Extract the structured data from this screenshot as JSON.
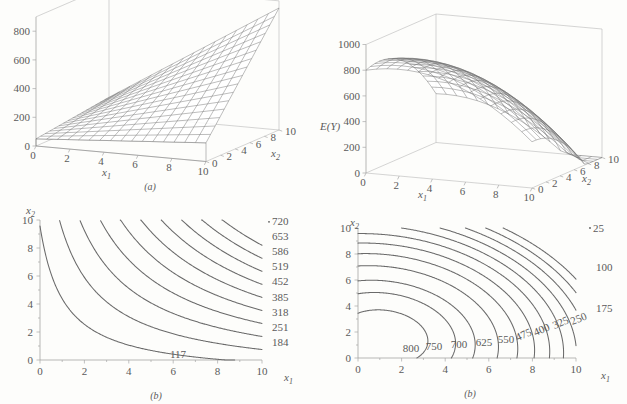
{
  "figure": {
    "panels": [
      "(a)",
      "(b)",
      "(a)",
      "(b)"
    ]
  },
  "chart_data": [
    {
      "id": "surface-linear-interaction",
      "type": "surface3d",
      "title": "",
      "panel_label": "(a)",
      "xlabel": "x₁",
      "ylabel": "x₂",
      "zlabel": "",
      "xlim": [
        0,
        10
      ],
      "ylim": [
        0,
        10
      ],
      "zlim": [
        0,
        900
      ],
      "xticks": [
        0,
        2,
        4,
        6,
        8,
        10
      ],
      "ytick_labels": [
        "0",
        "2",
        "4",
        "6",
        "8",
        "10"
      ],
      "zticks": [
        0,
        200,
        400,
        600,
        800
      ],
      "ztick_labels": [
        "0",
        "200",
        "400",
        "600",
        "800"
      ],
      "grid": true,
      "description": "Planar/ruled surface rising toward large x1 and x2; E(Y)=50+8x1+7x2+6.5x1x2 style first-order-with-interaction model",
      "corner_values": {
        "x1_0_x2_0": 50,
        "x1_10_x2_0": 130,
        "x1_0_x2_10": 120,
        "x1_10_x2_10": 850
      }
    },
    {
      "id": "contour-linear-interaction",
      "type": "contour",
      "panel_label": "(b)",
      "xlabel": "x₁",
      "ylabel": "x₂",
      "xlim": [
        0,
        10
      ],
      "ylim": [
        0,
        10
      ],
      "xticks": [
        0,
        2,
        4,
        6,
        8,
        10
      ],
      "yticks": [
        0,
        2,
        4,
        6,
        8,
        10
      ],
      "xtick_labels": [
        "0",
        "2",
        "4",
        "6",
        "8",
        "10"
      ],
      "ytick_labels": [
        "0",
        "2",
        "4",
        "6",
        "8",
        "10"
      ],
      "grid": false,
      "levels": [
        117,
        184,
        251,
        318,
        385,
        452,
        519,
        586,
        653,
        720
      ],
      "level_labels": [
        "117",
        "184",
        "251",
        "318",
        "385",
        "452",
        "519",
        "586",
        "653",
        "720"
      ],
      "label_side": "right",
      "description": "Hyperbolic contours opening toward the origin, characteristic of an interaction (saddle-free monotone increasing) surface"
    },
    {
      "id": "surface-quadratic-dome",
      "type": "surface3d",
      "panel_label": "(a)",
      "xlabel": "x₁",
      "ylabel": "x₂",
      "zlabel": "E(Y)",
      "xlim": [
        0,
        10
      ],
      "ylim": [
        0,
        10
      ],
      "zlim": [
        0,
        1000
      ],
      "xticks": [
        0,
        2,
        4,
        6,
        8,
        10
      ],
      "ytick_labels": [
        "0",
        "2",
        "4",
        "6",
        "8",
        "10"
      ],
      "zticks": [
        0,
        200,
        400,
        600,
        800,
        1000
      ],
      "ztick_labels": [
        "0",
        "200",
        "400",
        "600",
        "800",
        "1000"
      ],
      "grid": true,
      "description": "Second-order (quadratic) dome-shaped response surface with a maximum near the low-x1, low-x2 region, falling off steeply at large x1",
      "peak_value": 830
    },
    {
      "id": "contour-quadratic-dome",
      "type": "contour",
      "panel_label": "(b)",
      "xlabel": "x₁",
      "ylabel": "x₂",
      "xlim": [
        0,
        10
      ],
      "ylim": [
        0,
        10
      ],
      "xticks": [
        0,
        2,
        4,
        6,
        8,
        10
      ],
      "yticks": [
        0,
        2,
        4,
        6,
        8,
        10
      ],
      "xtick_labels": [
        "0",
        "2",
        "4",
        "6",
        "8",
        "10"
      ],
      "ytick_labels": [
        "0",
        "2",
        "4",
        "6",
        "8",
        "10"
      ],
      "grid": false,
      "levels": [
        800,
        750,
        700,
        625,
        550,
        475,
        400,
        325,
        250,
        175,
        100,
        25
      ],
      "level_labels": [
        "800",
        "750",
        "700",
        "625",
        "550",
        "475",
        "400",
        "325",
        "250",
        "175",
        "100",
        "25"
      ],
      "center": [
        1.2,
        1.6
      ],
      "description": "Nested elliptical contours around an interior maximum near (1.2, 1.6); values decrease outward from 800 down to 25"
    }
  ],
  "panel_tl": {
    "caption": "(a)",
    "xlabel": "x",
    "xlabel_sub": "1",
    "ylabel": "x",
    "ylabel_sub": "2",
    "zticks": [
      "0",
      "200",
      "400",
      "600",
      "800"
    ],
    "xticks": [
      "0",
      "2",
      "4",
      "6",
      "8",
      "10"
    ],
    "yticks": [
      "0",
      "2",
      "4",
      "6",
      "8",
      "10"
    ]
  },
  "panel_tr": {
    "caption": "(a)",
    "zaxis_label": "E(Y)",
    "xlabel": "x",
    "xlabel_sub": "1",
    "ylabel": "x",
    "ylabel_sub": "2",
    "zticks": [
      "0",
      "200",
      "400",
      "600",
      "800",
      "1000"
    ],
    "xticks": [
      "0",
      "2",
      "4",
      "6",
      "8",
      "10"
    ],
    "yticks": [
      "0",
      "2",
      "4",
      "6",
      "8",
      "10"
    ]
  },
  "panel_bl": {
    "caption": "(b)",
    "xlabel": "x",
    "xlabel_sub": "1",
    "ylabel": "x",
    "ylabel_sub": "2",
    "xticks": [
      "0",
      "2",
      "4",
      "6",
      "8",
      "10"
    ],
    "yticks": [
      "0",
      "2",
      "4",
      "6",
      "8",
      "10"
    ],
    "labels": [
      "720",
      "653",
      "586",
      "519",
      "452",
      "385",
      "318",
      "251",
      "184"
    ],
    "inner_label": "117"
  },
  "panel_br": {
    "caption": "(b)",
    "xlabel": "x",
    "xlabel_sub": "1",
    "ylabel": "x",
    "ylabel_sub": "2",
    "xticks": [
      "0",
      "2",
      "4",
      "6",
      "8",
      "10"
    ],
    "yticks": [
      "0",
      "2",
      "4",
      "6",
      "8",
      "10"
    ],
    "right_labels": [
      "25",
      "100",
      "175"
    ],
    "diag_labels": [
      "250",
      "325",
      "400",
      "475"
    ],
    "low_labels": [
      "550",
      "625",
      "700",
      "750",
      "800"
    ]
  }
}
